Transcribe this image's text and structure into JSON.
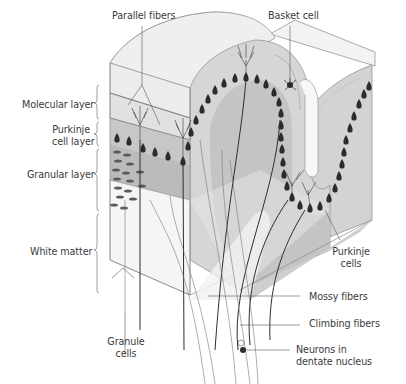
{
  "figure": {
    "colors": {
      "background": "#ffffff",
      "surface_light": "#ececec",
      "molecular_gray": "#d9d9d9",
      "granular_gray": "#bdbdbd",
      "white_matter": "#f4f4f4",
      "line": "#555555",
      "cell_dark": "#2b2b2b"
    }
  },
  "labels": {
    "left": {
      "molecular_layer": "Molecular layer",
      "purkinje_layer_line1": "Purkinje",
      "purkinje_layer_line2": "cell layer",
      "granular_layer": "Granular layer",
      "white_matter": "White matter"
    },
    "top": {
      "parallel_fibers": "Parallel fibers",
      "basket_cell": "Basket cell"
    },
    "right": {
      "purkinje_cells_line1": "Purkinje",
      "purkinje_cells_line2": "cells",
      "mossy_fibers": "Mossy fibers",
      "climbing_fibers": "Climbing fibers",
      "dentate_line1": "Neurons in",
      "dentate_line2": "dentate nucleus"
    },
    "bottom": {
      "granule_cells_line1": "Granule",
      "granule_cells_line2": "cells"
    }
  }
}
